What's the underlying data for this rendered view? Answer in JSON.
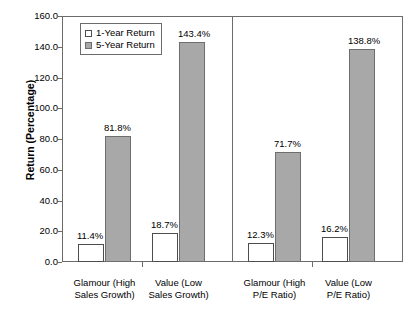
{
  "chart_data": {
    "type": "bar",
    "title": "",
    "xlabel": "",
    "ylabel": "Return (Percentage)",
    "ylim": [
      0,
      160
    ],
    "ytick_labels": [
      "0.0",
      "20.0",
      "40.0",
      "60.0",
      "80.0",
      "100.0",
      "120.0",
      "140.0",
      "160.0"
    ],
    "ytick_values": [
      0,
      20,
      40,
      60,
      80,
      100,
      120,
      140,
      160
    ],
    "grid": false,
    "legend_position": "upper-left-inside",
    "categories": [
      "Glamour (High Sales Growth)",
      "Value (Low Sales Growth)",
      "Glamour (High P/E Ratio)",
      "Value (Low P/E Ratio)"
    ],
    "category_labels": [
      {
        "line1": "Glamour (High",
        "line2": "Sales Growth)"
      },
      {
        "line1": "Value (Low",
        "line2": "Sales Growth)"
      },
      {
        "line1": "Glamour (High",
        "line2": "P/E Ratio)"
      },
      {
        "line1": "Value (Low",
        "line2": "P/E Ratio)"
      }
    ],
    "series": [
      {
        "name": "1-Year Return",
        "color": "#ffffff",
        "values": [
          11.4,
          18.7,
          12.3,
          16.2
        ],
        "value_labels": [
          "11.4%",
          "18.7%",
          "12.3%",
          "16.2%"
        ]
      },
      {
        "name": "5-Year Return",
        "color": "#a8a8a8",
        "values": [
          81.8,
          143.4,
          71.7,
          138.8
        ],
        "value_labels": [
          "81.8%",
          "143.4%",
          "71.7%",
          "138.8%"
        ]
      }
    ],
    "panels": [
      {
        "name": "Sales Growth",
        "categories": [
          0,
          1
        ]
      },
      {
        "name": "P/E Ratio",
        "categories": [
          2,
          3
        ]
      }
    ]
  },
  "legend": {
    "entries": [
      {
        "label": "1-Year Return",
        "swatch": "white-square"
      },
      {
        "label": "5-Year Return",
        "swatch": "gray-square"
      }
    ]
  },
  "colors": {
    "one_year_fill": "#ffffff",
    "five_year_fill": "#a8a8a8",
    "axis": "#6b6b6b",
    "text": "#000000",
    "background": "#ffffff"
  }
}
